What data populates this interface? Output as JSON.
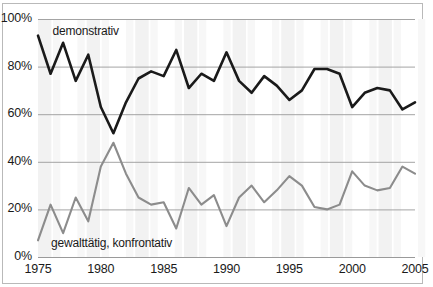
{
  "chart_data": {
    "type": "line",
    "title": "",
    "subtitle": "",
    "xlabel": "",
    "ylabel": "",
    "xlim": [
      1975,
      2005
    ],
    "ylim": [
      0,
      100
    ],
    "grid": true,
    "legend_position": "inline-annotation",
    "x": [
      1975,
      1976,
      1977,
      1978,
      1979,
      1980,
      1981,
      1982,
      1983,
      1984,
      1985,
      1986,
      1987,
      1988,
      1989,
      1990,
      1991,
      1992,
      1993,
      1994,
      1995,
      1996,
      1997,
      1998,
      1999,
      2000,
      2001,
      2002,
      2003,
      2004,
      2005
    ],
    "xticks": [
      1975,
      1980,
      1985,
      1990,
      1995,
      2000,
      2005
    ],
    "xticklabels": [
      "1975",
      "1980",
      "1985",
      "1990",
      "1995",
      "2000",
      "2005"
    ],
    "yticks": [
      0,
      20,
      40,
      60,
      80,
      100
    ],
    "yticklabels": [
      "0%",
      "20%",
      "40%",
      "60%",
      "80%",
      "100%"
    ],
    "series": [
      {
        "name": "demonstrativ",
        "color": "#1a1a1a",
        "label_x": 1976.0,
        "label_y": 95,
        "values": [
          93,
          77,
          90,
          74,
          85,
          63,
          52,
          65,
          75,
          78,
          76,
          87,
          71,
          77,
          74,
          86,
          74,
          69,
          76,
          72,
          66,
          70,
          79,
          79,
          77,
          63,
          69,
          71,
          70,
          62,
          65
        ]
      },
      {
        "name": "gewalttätig, konfrontativ",
        "color": "#8c8c8c",
        "label_x": 1976.2,
        "label_y": 6,
        "values": [
          7,
          22,
          10,
          25,
          15,
          38,
          48,
          35,
          25,
          22,
          23,
          12,
          29,
          22,
          26,
          13,
          25,
          30,
          23,
          28,
          34,
          30,
          21,
          20,
          22,
          36,
          30,
          28,
          29,
          38,
          35
        ]
      }
    ]
  },
  "axis": {
    "y_labels": [
      "100%",
      "80%",
      "60%",
      "40%",
      "20%",
      "0%"
    ],
    "x_labels": [
      "1975",
      "1980",
      "1985",
      "1990",
      "1995",
      "2000",
      "2005"
    ]
  },
  "annotations": {
    "demonstrativ_label": "demonstrativ",
    "gewalt_label": "gewalttätig, konfrontativ"
  },
  "colors": {
    "dark_series": "#1a1a1a",
    "gray_series": "#8c8c8c",
    "gridline": "#9a9a9a",
    "frame": "#b9b9b9",
    "band": "#f2f2f2",
    "background": "#ffffff"
  }
}
